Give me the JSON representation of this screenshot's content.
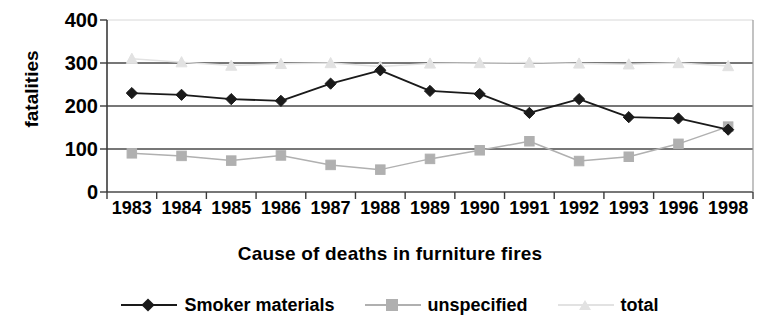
{
  "chart_data": {
    "type": "line",
    "title": "",
    "xlabel": "Cause of deaths in furniture fires",
    "ylabel": "fatalities",
    "ylim": [
      0,
      400
    ],
    "yticks": [
      0,
      100,
      200,
      300,
      400
    ],
    "grid": true,
    "legend_position": "bottom",
    "categories": [
      "1983",
      "1984",
      "1985",
      "1986",
      "1987",
      "1988",
      "1989",
      "1990",
      "1991",
      "1992",
      "1993",
      "1996",
      "1998"
    ],
    "series": [
      {
        "name": "Smoker materials",
        "marker": "diamond",
        "color": "#1a1a1a",
        "values": [
          230,
          226,
          216,
          212,
          252,
          283,
          235,
          228,
          184,
          216,
          174,
          171,
          145
        ]
      },
      {
        "name": "unspecified",
        "marker": "square",
        "color": "#b0b0b0",
        "values": [
          90,
          84,
          73,
          85,
          63,
          52,
          77,
          97,
          118,
          72,
          82,
          112,
          152
        ]
      },
      {
        "name": "total",
        "marker": "triangle",
        "color": "#e2e2e2",
        "values": [
          310,
          302,
          294,
          298,
          300,
          292,
          299,
          300,
          301,
          299,
          297,
          300,
          293
        ]
      }
    ]
  },
  "axis": {
    "y_title": "fatalities",
    "y_tick_labels": [
      "400",
      "300",
      "200",
      "100",
      "0"
    ],
    "x_tick_labels": [
      "1983",
      "1984",
      "1985",
      "1986",
      "1987",
      "1988",
      "1989",
      "1990",
      "1991",
      "1992",
      "1993",
      "1996",
      "1998"
    ],
    "x_title": "Cause of deaths in furniture fires"
  },
  "legend": {
    "entries": [
      {
        "label": "Smoker materials",
        "marker": "diamond-marker",
        "color": "#1a1a1a"
      },
      {
        "label": "unspecified",
        "marker": "square-marker",
        "color": "#b0b0b0"
      },
      {
        "label": "total",
        "marker": "triangle-marker",
        "color": "#e2e2e2"
      }
    ]
  },
  "colors": {
    "axis": "#3b3b3b",
    "gridline": "#4a4a4a",
    "smoker": "#1a1a1a",
    "unspecified": "#b0b0b0",
    "total": "#e2e2e2",
    "background": "#ffffff"
  }
}
